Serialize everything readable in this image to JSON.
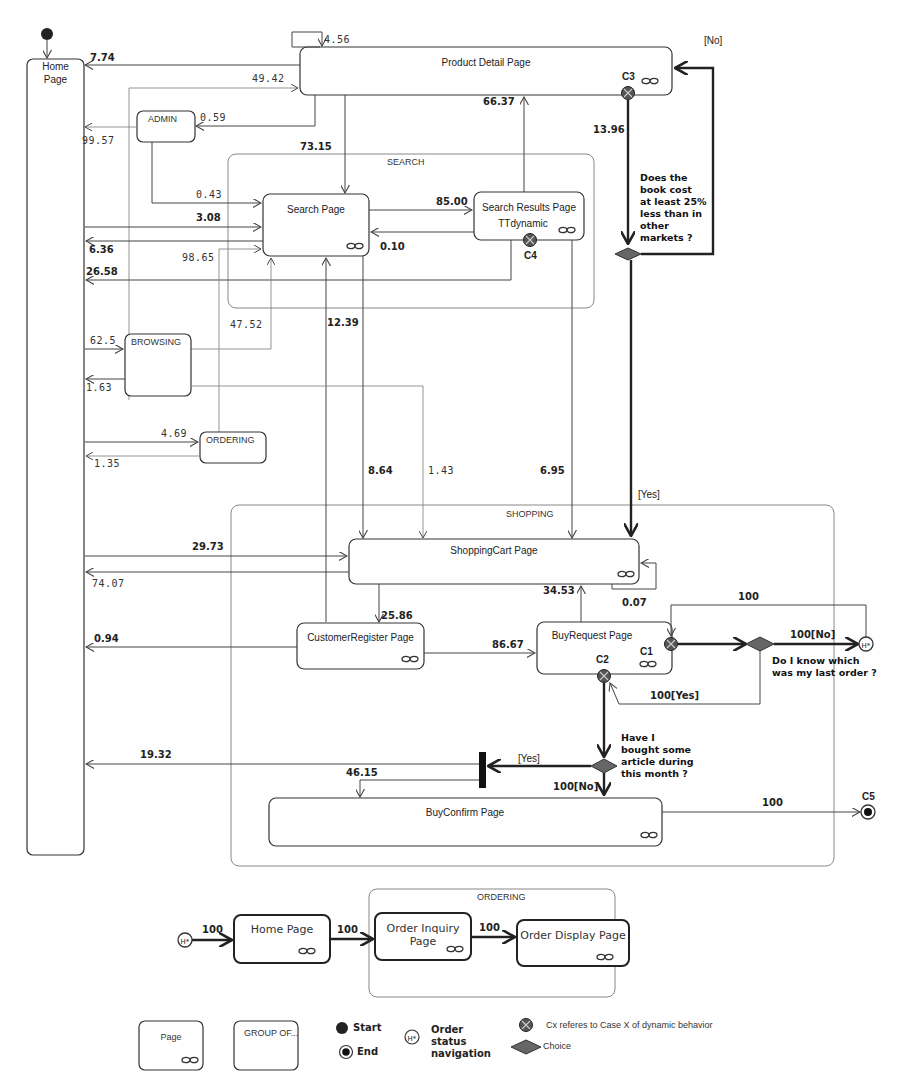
{
  "pages": {
    "home": "Home",
    "home2": "Page",
    "product_detail": "Product Detail Page",
    "search": "Search Page",
    "search_results": "Search Results Page",
    "search_results_sub": "TTdynamic",
    "shopping_cart": "ShoppingCart Page",
    "customer_register": "CustomerRegister Page",
    "buy_request": "BuyRequest Page",
    "buy_confirm": "BuyConfirm Page"
  },
  "groups": {
    "admin": "ADMIN",
    "search": "SEARCH",
    "browsing": "BROWSING",
    "ordering": "ORDERING",
    "shopping": "SHOPPING"
  },
  "cases": {
    "c1": "C1",
    "c2": "C2",
    "c3": "C3",
    "c4": "C4",
    "c5": "C5"
  },
  "transitions": {
    "pd_self": "4.56",
    "pd_to_home": "7.74",
    "to_pd_49": "49.42",
    "pd_to_admin": "0.59",
    "admin_to_home": "99.57",
    "pd_to_search": "73.15",
    "sr_to_pd": "66.37",
    "pd_c3": "13.96",
    "admin_to_search": "0.43",
    "home_to_search": "3.08",
    "search_to_sr": "85.00",
    "sr_to_search": "0.10",
    "search_to_home": "6.36",
    "sr_to_home": "26.58",
    "ordering_to_search": "98.65",
    "browsing_to_search": "47.52",
    "register_to_search": "12.39",
    "home_to_browsing": "62.5",
    "browsing_to_home": "1.63",
    "home_to_ordering": "4.69",
    "ordering_to_home": "1.35",
    "search_to_cart": "8.64",
    "browsing_to_cart": "1.43",
    "sr_to_cart": "6.95",
    "home_to_cart": "29.73",
    "cart_to_home": "74.07",
    "buyreq_to_cart": "34.53",
    "cart_self": "0.07",
    "cart_to_register": "25.86",
    "register_to_home": "0.94",
    "register_to_buyreq": "86.67",
    "c1_loop": "100",
    "c1_no": "100[No]",
    "c1_yes": "100[Yes]",
    "fork_to_home": "19.32",
    "fork_to_confirm": "46.15",
    "c2_yes": "[Yes]",
    "c2_no": "100[No]",
    "confirm_to_end": "100",
    "c3_no": "[No]",
    "c3_yes": "[Yes]"
  },
  "questions": {
    "q_price": [
      "Does the",
      "book cost",
      "at least 25%",
      "less than in",
      "other",
      "markets ?"
    ],
    "q_last_order": [
      "Do I know which",
      "was my last order ?"
    ],
    "q_bought": [
      "Have I",
      "bought some",
      "article during",
      "this month ?"
    ]
  },
  "order_status": {
    "history": "H*",
    "home": "Home Page",
    "group": "ORDERING",
    "inquiry1": "Order Inquiry",
    "inquiry2": "Page",
    "display": "Order Display Page",
    "t1": "100",
    "t2": "100",
    "t3": "100"
  },
  "legend": {
    "page": "Page",
    "group": "GROUP OF...",
    "start": "Start",
    "end": "End",
    "order_nav": [
      "Order",
      "status",
      "navigation"
    ],
    "case": "Cx referes to Case X of dynamic behavior",
    "choice": "Choice"
  },
  "colors": {
    "line": "#444444",
    "choice_fill": "#666666",
    "case_fill": "#555555"
  }
}
